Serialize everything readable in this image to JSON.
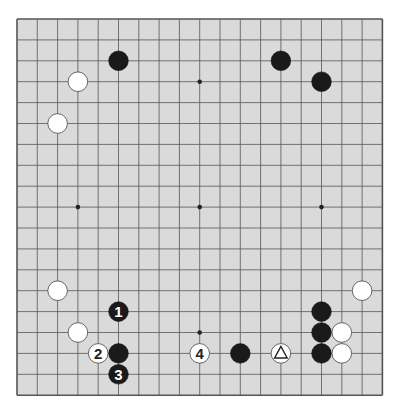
{
  "board": {
    "size": 19,
    "background_color": "#dadada",
    "line_color": "#555555",
    "hoshi": [
      [
        3,
        9
      ],
      [
        9,
        9
      ],
      [
        15,
        9
      ],
      [
        9,
        3
      ],
      [
        9,
        15
      ]
    ],
    "stones": [
      {
        "color": "black",
        "col": 5,
        "row": 2,
        "label": ""
      },
      {
        "color": "black",
        "col": 13,
        "row": 2,
        "label": ""
      },
      {
        "color": "black",
        "col": 15,
        "row": 3,
        "label": ""
      },
      {
        "color": "white",
        "col": 3,
        "row": 3,
        "label": ""
      },
      {
        "color": "white",
        "col": 2,
        "row": 5,
        "label": ""
      },
      {
        "color": "white",
        "col": 2,
        "row": 13,
        "label": ""
      },
      {
        "color": "black",
        "col": 5,
        "row": 14,
        "label": "1"
      },
      {
        "color": "white",
        "col": 3,
        "row": 15,
        "label": ""
      },
      {
        "color": "white",
        "col": 4,
        "row": 16,
        "label": "2"
      },
      {
        "color": "black",
        "col": 5,
        "row": 16,
        "label": ""
      },
      {
        "color": "black",
        "col": 5,
        "row": 17,
        "label": "3"
      },
      {
        "color": "white",
        "col": 9,
        "row": 16,
        "label": "4"
      },
      {
        "color": "black",
        "col": 11,
        "row": 16,
        "label": ""
      },
      {
        "color": "white",
        "col": 13,
        "row": 16,
        "label": "",
        "marker": "triangle"
      },
      {
        "color": "white",
        "col": 17,
        "row": 13,
        "label": ""
      },
      {
        "color": "black",
        "col": 15,
        "row": 14,
        "label": ""
      },
      {
        "color": "black",
        "col": 15,
        "row": 15,
        "label": ""
      },
      {
        "color": "white",
        "col": 16,
        "row": 15,
        "label": ""
      },
      {
        "color": "black",
        "col": 15,
        "row": 16,
        "label": ""
      },
      {
        "color": "white",
        "col": 16,
        "row": 16,
        "label": ""
      }
    ]
  }
}
